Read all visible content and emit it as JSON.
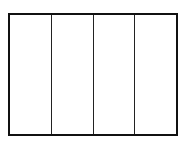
{
  "diagram": {
    "shape": "rectangle",
    "divisions": 4,
    "orientation": "vertical",
    "columns": [
      {
        "index": 1,
        "label": ""
      },
      {
        "index": 2,
        "label": ""
      },
      {
        "index": 3,
        "label": ""
      },
      {
        "index": 4,
        "label": ""
      }
    ],
    "colors": {
      "stroke": "#111111",
      "fill": "#ffffff"
    }
  }
}
